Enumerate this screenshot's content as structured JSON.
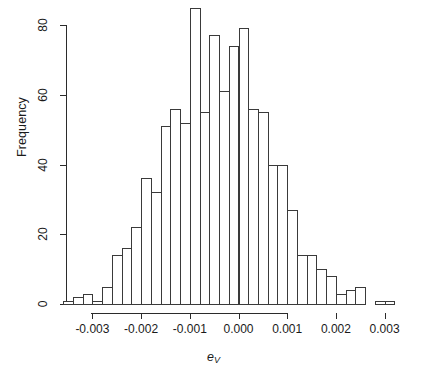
{
  "figure": {
    "type": "histogram-figure",
    "background": "#ffffff",
    "foreground": "#2b2b2b"
  },
  "axes": {
    "y": {
      "label": "Frequency",
      "ticks": [
        0,
        20,
        40,
        60,
        80
      ],
      "tick_labels": [
        "0",
        "20",
        "40",
        "60",
        "80"
      ],
      "range": [
        0,
        86
      ]
    },
    "x": {
      "label_base": "e",
      "label_sub": "V",
      "ticks": [
        -0.003,
        -0.002,
        -0.001,
        0.0,
        0.001,
        0.002,
        0.003
      ],
      "tick_labels": [
        "-0.003",
        "-0.002",
        "-0.001",
        "0.000",
        "0.001",
        "0.002",
        "0.003"
      ],
      "range": [
        -0.0037,
        0.0035
      ]
    }
  },
  "chart_data": {
    "type": "bar",
    "title": "",
    "subtitle": "",
    "xlabel": "e_V",
    "ylabel": "Frequency",
    "xlim": [
      -0.0037,
      0.0035
    ],
    "ylim": [
      0,
      86
    ],
    "grid": false,
    "legend": null,
    "bin_width": 0.0002,
    "bin_left_edges": [
      -0.0036,
      -0.0034,
      -0.0032,
      -0.003,
      -0.0028,
      -0.0026,
      -0.0024,
      -0.0022,
      -0.002,
      -0.0018,
      -0.0016,
      -0.0014,
      -0.0012,
      -0.001,
      -0.0008,
      -0.0006,
      -0.0004,
      -0.0002,
      0.0,
      0.0002,
      0.0004,
      0.0006,
      0.0008,
      0.001,
      0.0012,
      0.0014,
      0.0016,
      0.0018,
      0.002,
      0.0022,
      0.0024,
      0.0026,
      0.0028,
      0.003
    ],
    "categories": [
      "-0.0036",
      "-0.0034",
      "-0.0032",
      "-0.0030",
      "-0.0028",
      "-0.0026",
      "-0.0024",
      "-0.0022",
      "-0.0020",
      "-0.0018",
      "-0.0016",
      "-0.0014",
      "-0.0012",
      "-0.0010",
      "-0.0008",
      "-0.0006",
      "-0.0004",
      "-0.0002",
      "0.0000",
      "0.0002",
      "0.0004",
      "0.0006",
      "0.0008",
      "0.0010",
      "0.0012",
      "0.0014",
      "0.0016",
      "0.0018",
      "0.0020",
      "0.0022",
      "0.0024",
      "0.0026",
      "0.0028",
      "0.0030"
    ],
    "values": [
      1,
      2,
      3,
      1,
      5,
      14,
      16,
      22,
      36,
      32,
      51,
      56,
      52,
      85,
      55,
      77,
      61,
      74,
      79,
      56,
      55,
      40,
      40,
      27,
      14,
      14,
      10,
      8,
      3,
      4,
      5,
      0,
      1,
      1
    ]
  }
}
